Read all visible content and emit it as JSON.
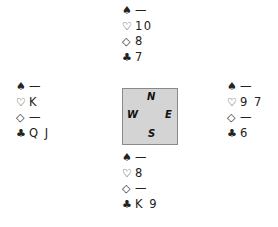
{
  "hands": {
    "north": {
      "spades": "—",
      "hearts": "10",
      "diamonds": "8",
      "clubs": "7"
    },
    "west": {
      "spades": "—",
      "hearts": "K",
      "diamonds": "—",
      "clubs": "Q J"
    },
    "east": {
      "spades": "—",
      "hearts": "9 7",
      "diamonds": "—",
      "clubs": "6"
    },
    "south": {
      "spades": "—",
      "hearts": "8",
      "diamonds": "—",
      "clubs": "K 9"
    }
  },
  "suit_symbols": {
    "spades": "♠",
    "hearts": "♡",
    "diamonds": "◇",
    "clubs": "♣"
  },
  "compass": {
    "north": "N",
    "west": "W",
    "east": "E",
    "south": "S"
  }
}
